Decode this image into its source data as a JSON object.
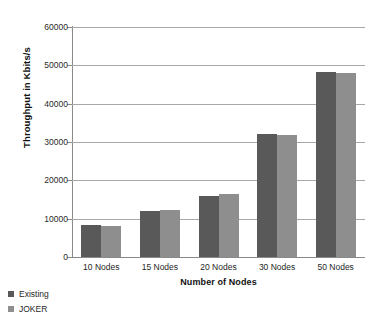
{
  "chart_data": {
    "type": "bar",
    "title": "",
    "xlabel": "Number of Nodes",
    "ylabel": "Throughput in Kbits/s",
    "categories": [
      "10 Nodes",
      "15 Nodes",
      "20 Nodes",
      "30 Nodes",
      "50 Nodes"
    ],
    "series": [
      {
        "name": "Existing",
        "color": "#595959",
        "values": [
          8300,
          12000,
          16000,
          32000,
          48300
        ]
      },
      {
        "name": "JOKER",
        "color": "#8e8e8e",
        "values": [
          8000,
          12300,
          16500,
          31800,
          48000
        ]
      }
    ],
    "ylim": [
      0,
      60000
    ],
    "ytick_labels": [
      "0",
      "10000",
      "20000",
      "30000",
      "40000",
      "50000",
      "60000"
    ],
    "ytick_values": [
      0,
      10000,
      20000,
      30000,
      40000,
      50000,
      60000
    ],
    "grid": "horizontal",
    "legend_position": "bottom-left",
    "legend_orientation": "vertical"
  }
}
